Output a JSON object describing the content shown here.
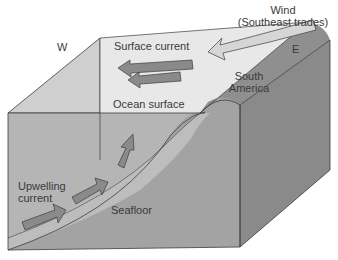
{
  "labels": {
    "wind_line1": "Wind",
    "wind_line2": "(Southeast trades)",
    "west": "W",
    "east": "E",
    "surface_current": "Surface current",
    "ocean_surface": "Ocean surface",
    "south_america_line1": "South",
    "south_america_line2": "America",
    "upwelling_line1": "Upwelling",
    "upwelling_line2": "current",
    "seafloor": "Seafloor"
  },
  "colors": {
    "ocean_top": "#e6e6e6",
    "ocean_side": "#b9b9b9",
    "ocean_front": "#a8a8a8",
    "land_top": "#8e8e8e",
    "land_front": "#9c9c9c",
    "land_side": "#8a8a8a",
    "arrow_fill": "#8a8a8a",
    "wind_fill": "#d6d6d6",
    "outline": "#3c3c3c"
  }
}
